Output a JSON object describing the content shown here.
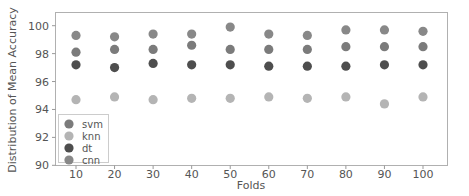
{
  "chart_data": {
    "type": "scatter",
    "title": "",
    "xlabel": "Folds",
    "ylabel": "Distribution of Mean Accuracy",
    "x": [
      10,
      20,
      30,
      40,
      50,
      60,
      70,
      80,
      90,
      100
    ],
    "xticks": [
      10,
      20,
      30,
      40,
      50,
      60,
      70,
      80,
      90,
      100
    ],
    "yticks": [
      90,
      92,
      94,
      96,
      98,
      100
    ],
    "xlim": [
      5,
      106
    ],
    "ylim": [
      90,
      101
    ],
    "grid": false,
    "legend_position": "lower left",
    "series": [
      {
        "name": "svm",
        "color": "#7b7b7b",
        "values": [
          98.1,
          98.3,
          98.3,
          98.6,
          98.3,
          98.3,
          98.3,
          98.5,
          98.5,
          98.5
        ]
      },
      {
        "name": "knn",
        "color": "#b4b4b4",
        "values": [
          94.7,
          94.9,
          94.7,
          94.8,
          94.8,
          94.9,
          94.8,
          94.9,
          94.4,
          94.9
        ]
      },
      {
        "name": "dt",
        "color": "#4e4e4e",
        "values": [
          97.2,
          97.0,
          97.3,
          97.2,
          97.2,
          97.1,
          97.1,
          97.1,
          97.2,
          97.2
        ]
      },
      {
        "name": "cnn",
        "color": "#888888",
        "values": [
          99.3,
          99.2,
          99.4,
          99.4,
          99.9,
          99.4,
          99.3,
          99.7,
          99.7,
          99.6
        ]
      }
    ]
  }
}
